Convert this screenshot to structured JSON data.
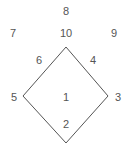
{
  "figure": {
    "name": "diamond-region-label-diagram",
    "background_color": "#ffffff",
    "stroke_color": "#555555",
    "text_color": "#555555",
    "stroke_width": 1,
    "width": 132,
    "height": 151
  },
  "shape": {
    "type": "diamond",
    "points": "66,47 108,96 66,143 23,96",
    "vertices": [
      {
        "name": "top",
        "x": 66,
        "y": 47
      },
      {
        "name": "right",
        "x": 108,
        "y": 96
      },
      {
        "name": "bottom",
        "x": 66,
        "y": 143
      },
      {
        "name": "left",
        "x": 23,
        "y": 96
      }
    ]
  },
  "labels": [
    {
      "id": "label-8",
      "text": "8",
      "x": 66,
      "y": 11
    },
    {
      "id": "label-7",
      "text": "7",
      "x": 13,
      "y": 33
    },
    {
      "id": "label-10",
      "text": "10",
      "x": 66,
      "y": 33
    },
    {
      "id": "label-9",
      "text": "9",
      "x": 114,
      "y": 33
    },
    {
      "id": "label-6",
      "text": "6",
      "x": 39,
      "y": 60
    },
    {
      "id": "label-4",
      "text": "4",
      "x": 93,
      "y": 60
    },
    {
      "id": "label-5",
      "text": "5",
      "x": 14,
      "y": 97
    },
    {
      "id": "label-1",
      "text": "1",
      "x": 66,
      "y": 97
    },
    {
      "id": "label-3",
      "text": "3",
      "x": 118,
      "y": 97
    },
    {
      "id": "label-2",
      "text": "2",
      "x": 66,
      "y": 124
    }
  ]
}
